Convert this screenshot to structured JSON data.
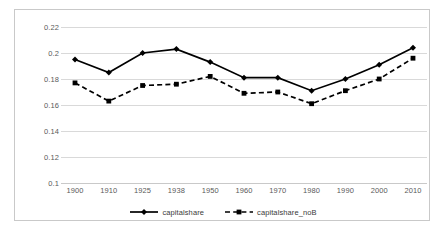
{
  "chart_data": {
    "type": "line",
    "title": "",
    "subtitle": "",
    "xlabel": "",
    "ylabel": "",
    "categories": [
      "1900",
      "1910",
      "1925",
      "1938",
      "1950",
      "1960",
      "1970",
      "1980",
      "1990",
      "2000",
      "2010"
    ],
    "series": [
      {
        "name": "capitalshare",
        "style": "solid",
        "marker": "diamond",
        "color": "#000000",
        "values": [
          0.195,
          0.185,
          0.2,
          0.203,
          0.193,
          0.181,
          0.181,
          0.171,
          0.18,
          0.191,
          0.204
        ]
      },
      {
        "name": "capitalshare_noB",
        "style": "dashed",
        "marker": "square",
        "color": "#000000",
        "values": [
          0.177,
          0.163,
          0.175,
          0.176,
          0.182,
          0.169,
          0.17,
          0.161,
          0.171,
          0.18,
          0.196
        ]
      }
    ],
    "ylim": [
      0.1,
      0.22
    ],
    "ytick_step": 0.02,
    "yticks": [
      "0.22",
      "0.2",
      "0.18",
      "0.16",
      "0.14",
      "0.12",
      "0.1"
    ],
    "grid": true,
    "grid_axis": "y",
    "legend_position": "bottom",
    "colors": {
      "series_1": "#000000",
      "series_2": "#000000",
      "gridline": "#d9d9d9",
      "frame": "#c9c9c9",
      "tick_text": "#5a5a5a",
      "legend_text": "#3a3a3a",
      "plot_background": "#ffffff"
    }
  }
}
